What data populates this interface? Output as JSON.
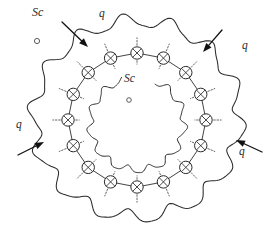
{
  "figure": {
    "width": 274,
    "height": 231,
    "background_color": "#ffffff",
    "ink_color": "#2b2b2b"
  },
  "labels": {
    "sc_legend": "Sc",
    "sc_center": "Sc",
    "q_top": "q",
    "q_right_top": "q",
    "q_left": "q",
    "q_right_bottom": "q"
  },
  "legend": {
    "marker_name": "small-open-circle",
    "marker_label": "Sc"
  },
  "arrows": [
    {
      "name": "q-arrow-top",
      "label": "q",
      "direction": "down-right",
      "x1": 62,
      "y1": 22,
      "x2": 88,
      "y2": 47
    },
    {
      "name": "q-arrow-top-right",
      "label": "q",
      "direction": "down-left",
      "x1": 222,
      "y1": 30,
      "x2": 203,
      "y2": 52
    },
    {
      "name": "q-arrow-left",
      "label": "q",
      "direction": "up-right",
      "x1": 18,
      "y1": 155,
      "x2": 44,
      "y2": 142
    },
    {
      "name": "q-arrow-right-bottom",
      "label": "q",
      "direction": "up-left",
      "x1": 262,
      "y1": 152,
      "x2": 236,
      "y2": 140
    }
  ],
  "ring": {
    "node_count": 16,
    "node_name": "crossed-circle-node",
    "node_radius": 6.2,
    "center_x": 137,
    "center_y": 120,
    "ring_radius_x": 69,
    "ring_radius_y": 67,
    "start_angle_deg": -90,
    "tick_length": 9,
    "tick_style": "dashed-radial"
  },
  "contours": {
    "outer": {
      "name": "outer-wavy-contour",
      "center_x": 137,
      "center_y": 119,
      "base_radius_x": 103,
      "base_radius_y": 98,
      "wave_count": 14,
      "wave_amplitude": 6.5,
      "phase_deg": 10
    },
    "inner": {
      "name": "inner-wavy-contour",
      "center_x": 137,
      "center_y": 124,
      "base_radius_x": 47,
      "base_radius_y": 46,
      "wave_count": 13,
      "wave_amplitude": 3.4,
      "phase_deg": 25,
      "gap_start_deg": -108,
      "gap_end_deg": -66
    }
  },
  "markers": {
    "legend_dot": {
      "x": 37,
      "y": 41,
      "r": 2.6
    },
    "center_dot": {
      "x": 129,
      "y": 100,
      "r": 2.3
    }
  }
}
